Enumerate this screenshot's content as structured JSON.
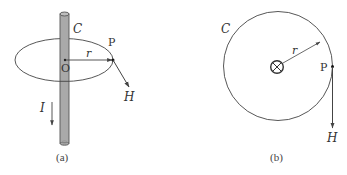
{
  "figure_a": {
    "caption": "(a)",
    "curve_label": "C",
    "point_label": "P",
    "radius_label": "r",
    "center_label": "O",
    "field_label": "H",
    "current_label": "I",
    "colors": {
      "rod_fill": "#a9a9a9",
      "rod_stroke": "#555555",
      "line": "#444444"
    }
  },
  "figure_b": {
    "caption": "(b)",
    "curve_label": "C",
    "point_label": "P",
    "radius_label": "r",
    "field_label": "H",
    "center_symbol": "current-into-page-icon",
    "colors": {
      "line": "#444444"
    }
  }
}
